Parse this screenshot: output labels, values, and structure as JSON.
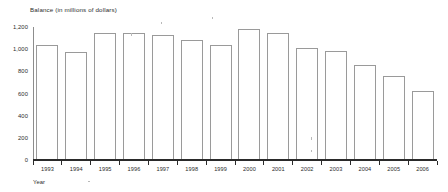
{
  "chart_data": {
    "type": "bar",
    "title": "Balance (in millions of dollars)",
    "xlabel": "Year",
    "ylabel": "",
    "categories": [
      "1993",
      "1994",
      "1995",
      "1996",
      "1997",
      "1998",
      "1999",
      "2000",
      "2001",
      "2002",
      "2003",
      "2004",
      "2005",
      "2006"
    ],
    "values": [
      1040,
      975,
      1150,
      1150,
      1130,
      1085,
      1035,
      1185,
      1150,
      1015,
      980,
      860,
      755,
      625
    ],
    "ylim": [
      0,
      1200
    ],
    "ytick_labels": [
      "1,200",
      "1,000",
      "800",
      "600",
      "400",
      "200",
      "0"
    ],
    "ytick_values": [
      1200,
      1000,
      800,
      600,
      400,
      200,
      0
    ],
    "grid": false,
    "legend": null,
    "bar_fill_color": "#ffffff",
    "bar_border_color": "#9a9a9a",
    "axis_color": "#2a2a2a",
    "text_color": "#2b2b2b"
  }
}
